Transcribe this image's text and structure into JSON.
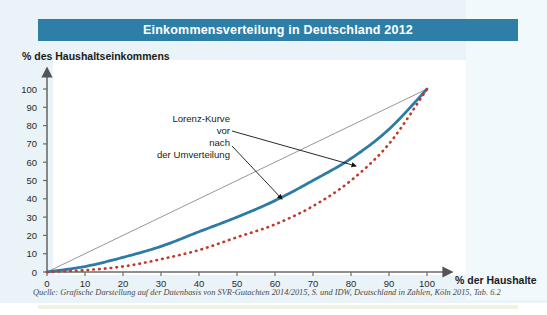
{
  "header": {
    "title": "Einkommensverteilung in Deutschland 2012",
    "bar_color": "#2e7fa8"
  },
  "axes": {
    "ylabel": "% des Haushaltseinkommens",
    "xlabel": "% der Haushalte"
  },
  "source": "Quelle: Grafische Darstellung auf der Datenbasis von SVR-Gutachten 2014/2015, S. und IDW, Deutschland in Zahlen, Köln 2015, Tab. 6.2",
  "annotations": {
    "line1": "Lorenz-Kurve",
    "line2": "vor",
    "line3": "nach",
    "line4": "der Umverteilung"
  },
  "chart_data": {
    "type": "line",
    "title": "Einkommensverteilung in Deutschland 2012",
    "xlabel": "% der Haushalte",
    "ylabel": "% des Haushaltseinkommens",
    "xlim": [
      0,
      100
    ],
    "ylim": [
      0,
      100
    ],
    "xticks": [
      0,
      10,
      20,
      30,
      40,
      50,
      60,
      70,
      80,
      90,
      100
    ],
    "yticks": [
      0,
      10,
      20,
      30,
      40,
      50,
      60,
      70,
      80,
      90,
      100
    ],
    "grid": false,
    "legend": "annotated",
    "series": [
      {
        "name": "Gleichverteilung (45°-Linie)",
        "style": "thin-solid",
        "color": "#8a8a8a",
        "x": [
          0,
          100
        ],
        "values": [
          0,
          100
        ]
      },
      {
        "name": "Lorenz-Kurve nach der Umverteilung",
        "style": "solid",
        "color": "#2e7ba6",
        "x": [
          0,
          10,
          20,
          30,
          40,
          50,
          60,
          70,
          80,
          90,
          100
        ],
        "values": [
          0,
          3,
          8,
          14,
          22,
          30,
          39,
          50,
          62,
          78,
          100
        ]
      },
      {
        "name": "Lorenz-Kurve vor der Umverteilung",
        "style": "dotted",
        "color": "#c0392b",
        "x": [
          0,
          10,
          20,
          30,
          40,
          50,
          60,
          70,
          80,
          90,
          100
        ],
        "values": [
          0,
          1,
          3,
          7,
          12,
          19,
          26,
          36,
          50,
          70,
          100
        ]
      }
    ]
  }
}
